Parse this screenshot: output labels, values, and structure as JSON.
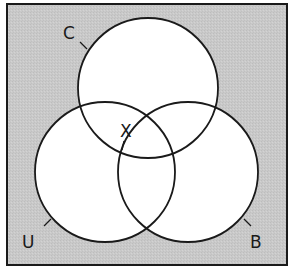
{
  "diagram": {
    "type": "venn",
    "universe_fill": "#c8c8c8",
    "set_fill": "#ffffff",
    "stroke_color": "#1a1a1a",
    "sets": [
      {
        "id": "C",
        "label": "C"
      },
      {
        "id": "U",
        "label": "U"
      },
      {
        "id": "B",
        "label": "B"
      }
    ],
    "region_labels": [
      {
        "label": "X",
        "region": "C∩U∩B"
      }
    ]
  }
}
